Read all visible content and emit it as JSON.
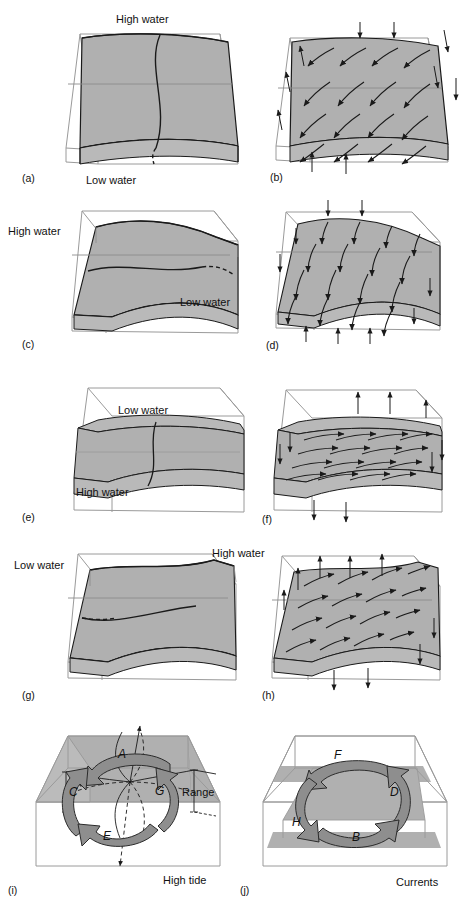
{
  "figure": {
    "colors": {
      "surface_fill": "#b0b0b0",
      "surface_fill_dark": "#a2a2a2",
      "surface_fill_light": "#c2c2c2",
      "box_line": "#9a9a9a",
      "curve_line": "#1a1a1a",
      "arrow_fill": "#8e8e8e",
      "arrow_stroke": "#2b2b2b",
      "text": "#111111",
      "background": "#ffffff"
    },
    "panels": [
      {
        "id": "a",
        "tag": "(a)",
        "kind": "water-surface",
        "labels": [
          {
            "name": "high-water-label",
            "text": "High water",
            "x": 116,
            "y": 14
          },
          {
            "name": "low-water-label",
            "text": "Low water",
            "x": 86,
            "y": 175
          }
        ]
      },
      {
        "id": "b",
        "tag": "(b)",
        "kind": "currents",
        "labels": []
      },
      {
        "id": "c",
        "tag": "(c)",
        "kind": "water-surface",
        "labels": [
          {
            "name": "high-water-label",
            "text": "High water",
            "x": 8,
            "y": 226
          },
          {
            "name": "low-water-label",
            "text": "Low water",
            "x": 180,
            "y": 297
          }
        ]
      },
      {
        "id": "d",
        "tag": "(d)",
        "kind": "currents",
        "labels": []
      },
      {
        "id": "e",
        "tag": "(e)",
        "kind": "water-surface",
        "labels": [
          {
            "name": "low-water-label",
            "text": "Low water",
            "x": 118,
            "y": 405
          },
          {
            "name": "high-water-label",
            "text": "High water",
            "x": 76,
            "y": 487
          }
        ]
      },
      {
        "id": "f",
        "tag": "(f)",
        "kind": "currents",
        "labels": []
      },
      {
        "id": "g",
        "tag": "(g)",
        "kind": "water-surface",
        "labels": [
          {
            "name": "low-water-label",
            "text": "Low water",
            "x": 14,
            "y": 560
          },
          {
            "name": "high-water-label",
            "text": "High water",
            "x": 212,
            "y": 548
          }
        ]
      },
      {
        "id": "h",
        "tag": "(h)",
        "kind": "currents",
        "labels": []
      },
      {
        "id": "i",
        "tag": "(i)",
        "kind": "amphidromic-tide",
        "labels": [
          {
            "name": "range-label",
            "text": "Range",
            "x": 182,
            "y": 787
          },
          {
            "name": "high-tide-label",
            "text": "High tide",
            "x": 163,
            "y": 875
          }
        ],
        "arrow_labels": [
          {
            "name": "arrow-label-a",
            "text": "A",
            "x": 118,
            "y": 749
          },
          {
            "name": "arrow-label-c",
            "text": "C",
            "x": 69,
            "y": 787
          },
          {
            "name": "arrow-label-e",
            "text": "E",
            "x": 103,
            "y": 831
          },
          {
            "name": "arrow-label-g",
            "text": "G",
            "x": 155,
            "y": 786
          }
        ]
      },
      {
        "id": "j",
        "tag": "(j)",
        "kind": "amphidromic-currents",
        "labels": [
          {
            "name": "currents-label",
            "text": "Currents",
            "x": 396,
            "y": 877
          }
        ],
        "arrow_labels": [
          {
            "name": "arrow-label-f",
            "text": "F",
            "x": 334,
            "y": 750
          },
          {
            "name": "arrow-label-d",
            "text": "D",
            "x": 390,
            "y": 787
          },
          {
            "name": "arrow-label-h",
            "text": "H",
            "x": 292,
            "y": 817
          },
          {
            "name": "arrow-label-b",
            "text": "B",
            "x": 352,
            "y": 832
          }
        ]
      }
    ]
  }
}
